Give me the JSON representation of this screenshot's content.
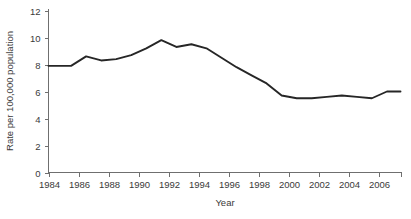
{
  "chart_data": {
    "type": "line",
    "title": "",
    "subtitle": "",
    "xlabel": "Year",
    "ylabel": "Rate per 100,000 population",
    "xlim": [
      1984,
      2007.5
    ],
    "ylim": [
      0,
      12
    ],
    "grid": false,
    "legend": null,
    "legend_position": "none",
    "x_ticks": [
      1984,
      1986,
      1988,
      1990,
      1992,
      1994,
      1996,
      1998,
      2000,
      2002,
      2004,
      2006
    ],
    "x_tick_labels": [
      "1984",
      "1986",
      "1988",
      "1990",
      "1992",
      "1994",
      "1996",
      "1998",
      "2000",
      "2002",
      "2004",
      "2006"
    ],
    "y_ticks": [
      0,
      2,
      4,
      6,
      8,
      10,
      12
    ],
    "y_tick_labels": [
      "0",
      "2",
      "4",
      "6",
      "8",
      "10",
      "12"
    ],
    "line_color": "#262626",
    "series": [
      {
        "name": "Rate",
        "x": [
          1984.0,
          1985.5,
          1986.5,
          1987.5,
          1988.5,
          1989.5,
          1990.5,
          1991.5,
          1992.5,
          1993.5,
          1994.5,
          1995.5,
          1996.5,
          1997.5,
          1998.5,
          1999.5,
          2000.5,
          2001.5,
          2002.5,
          2003.5,
          2004.5,
          2005.5,
          2006.5,
          2007.4
        ],
        "values": [
          7.9,
          7.9,
          8.6,
          8.3,
          8.4,
          8.7,
          9.2,
          9.8,
          9.3,
          9.5,
          9.2,
          8.5,
          7.8,
          7.2,
          6.6,
          5.7,
          5.5,
          5.5,
          5.6,
          5.7,
          5.6,
          5.5,
          6.0,
          6.0
        ]
      }
    ]
  },
  "axes": {
    "y_axis_label": "Rate per 100,000 population",
    "x_axis_label": "Year"
  }
}
